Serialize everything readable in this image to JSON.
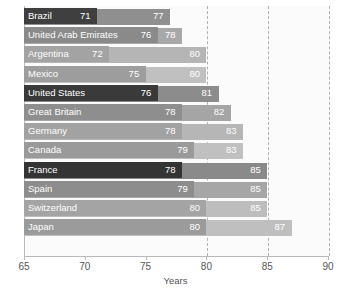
{
  "chart_data": {
    "type": "bar",
    "orientation": "horizontal",
    "title": "",
    "xlabel": "Years",
    "ylabel": "",
    "xlim": [
      65,
      90
    ],
    "xticks": [
      65,
      70,
      75,
      80,
      85,
      90
    ],
    "xtick_labels": [
      "65",
      "70",
      "75",
      "80",
      "85",
      "90"
    ],
    "grid": "vertical dashed gridlines at 80, 85, 90",
    "legend": "none",
    "categories": [
      "Brazil",
      "United Arab Emirates",
      "Argentina",
      "Mexico",
      "United States",
      "Great Britain",
      "Germany",
      "Canada",
      "France",
      "Spain",
      "Switzerland",
      "Japan"
    ],
    "series": [
      {
        "name": "inner",
        "values": [
          71,
          76,
          72,
          75,
          76,
          78,
          78,
          79,
          78,
          79,
          80,
          80
        ]
      },
      {
        "name": "outer",
        "values": [
          77,
          78,
          80,
          80,
          81,
          82,
          83,
          83,
          85,
          85,
          85,
          87
        ]
      }
    ],
    "rows": [
      {
        "label": "Brazil",
        "inner": 71,
        "outer": 77,
        "inner_color": "#3f3f3f",
        "outer_color": "#8f8f8f"
      },
      {
        "label": "United Arab Emirates",
        "inner": 76,
        "outer": 78,
        "inner_color": "#8a8a8a",
        "outer_color": "#a8a8a8"
      },
      {
        "label": "Argentina",
        "inner": 72,
        "outer": 80,
        "inner_color": "#a3a3a3",
        "outer_color": "#b5b5b5"
      },
      {
        "label": "Mexico",
        "inner": 75,
        "outer": 80,
        "inner_color": "#9d9d9d",
        "outer_color": "#c0c0c0"
      },
      {
        "label": "United States",
        "inner": 76,
        "outer": 81,
        "inner_color": "#3a3a3a",
        "outer_color": "#8c8c8c"
      },
      {
        "label": "Great Britain",
        "inner": 78,
        "outer": 82,
        "inner_color": "#8e8e8e",
        "outer_color": "#a5a5a5"
      },
      {
        "label": "Germany",
        "inner": 78,
        "outer": 83,
        "inner_color": "#a2a2a2",
        "outer_color": "#b6b6b6"
      },
      {
        "label": "Canada",
        "inner": 79,
        "outer": 83,
        "inner_color": "#9a9a9a",
        "outer_color": "#c0c0c0"
      },
      {
        "label": "France",
        "inner": 78,
        "outer": 85,
        "inner_color": "#343434",
        "outer_color": "#8a8a8a"
      },
      {
        "label": "Spain",
        "inner": 79,
        "outer": 85,
        "inner_color": "#8d8d8d",
        "outer_color": "#a6a6a6"
      },
      {
        "label": "Switzerland",
        "inner": 80,
        "outer": 85,
        "inner_color": "#a4a4a4",
        "outer_color": "#bdbdbd"
      },
      {
        "label": "Japan",
        "inner": 80,
        "outer": 87,
        "inner_color": "#9b9b9b",
        "outer_color": "#bfbfbf"
      }
    ]
  }
}
